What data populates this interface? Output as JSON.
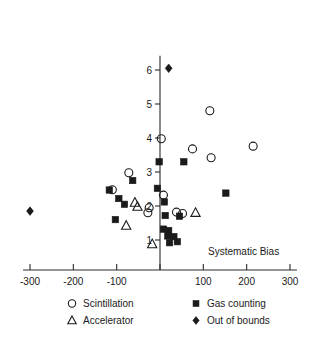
{
  "chart_data": {
    "type": "scatter",
    "title": "",
    "xlabel": "Systematic Bias",
    "ylabel": "",
    "xlim": [
      -316,
      316
    ],
    "ylim": [
      0.45,
      6.45
    ],
    "grid": false,
    "legend_position": "bottom",
    "xticks": [
      -300,
      -200,
      -100,
      0,
      100,
      200,
      300
    ],
    "xtick_labels": [
      "-300",
      "-200",
      "-100",
      "",
      "100",
      "200",
      "300"
    ],
    "yticks": [
      1,
      2,
      3,
      4,
      5,
      6
    ],
    "ytick_labels": [
      "1",
      "2",
      "3",
      "4",
      "5",
      "6"
    ],
    "series": [
      {
        "name": "Scintillation",
        "marker": "open-circle",
        "points": [
          [
            3,
            3.98
          ],
          [
            115,
            4.8
          ],
          [
            215,
            3.76
          ],
          [
            75,
            3.68
          ],
          [
            118,
            3.42
          ],
          [
            -72,
            2.98
          ],
          [
            -110,
            2.48
          ],
          [
            8,
            2.32
          ],
          [
            -25,
            1.95
          ],
          [
            -28,
            1.8
          ],
          [
            38,
            1.82
          ],
          [
            52,
            1.78
          ]
        ]
      },
      {
        "name": "Gas counting",
        "marker": "filled-square",
        "points": [
          [
            -2,
            3.3
          ],
          [
            55,
            3.3
          ],
          [
            -63,
            2.75
          ],
          [
            -117,
            2.47
          ],
          [
            -95,
            2.22
          ],
          [
            -82,
            2.05
          ],
          [
            -6,
            2.52
          ],
          [
            10,
            2.12
          ],
          [
            152,
            2.38
          ],
          [
            12,
            1.72
          ],
          [
            45,
            1.7
          ],
          [
            -103,
            1.6
          ],
          [
            8,
            1.32
          ],
          [
            20,
            1.28
          ],
          [
            18,
            1.12
          ],
          [
            32,
            1.1
          ],
          [
            22,
            0.92
          ],
          [
            40,
            0.95
          ]
        ]
      },
      {
        "name": "Accelerator",
        "marker": "open-triangle",
        "points": [
          [
            -58,
            2.1
          ],
          [
            -52,
            1.98
          ],
          [
            82,
            1.8
          ],
          [
            -78,
            1.42
          ],
          [
            -18,
            0.88
          ]
        ]
      },
      {
        "name": "Out of bounds",
        "marker": "filled-diamond",
        "points": [
          [
            20,
            6.05
          ],
          [
            -300,
            1.85
          ]
        ]
      }
    ]
  },
  "axis_title": {
    "text": "Systematic Bias"
  },
  "legend": {
    "entries": [
      {
        "label": "Scintillation",
        "marker": "open-circle"
      },
      {
        "label": "Gas counting",
        "marker": "filled-square"
      },
      {
        "label": "Accelerator",
        "marker": "open-triangle"
      },
      {
        "label": "Out of bounds",
        "marker": "filled-diamond"
      }
    ]
  },
  "colors": {
    "ink": "#1a1a1a",
    "axis": "#2b2b2b",
    "background": "#ffffff"
  }
}
